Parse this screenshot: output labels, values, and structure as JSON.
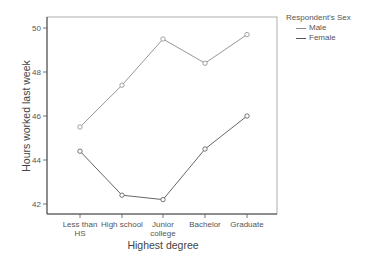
{
  "chart_data": {
    "type": "line",
    "title": "",
    "xlabel": "Highest degree",
    "ylabel": "Hours worked last week",
    "categories": [
      "Less than HS",
      "High school",
      "Junior college",
      "Bachelor",
      "Graduate"
    ],
    "category_lines": [
      [
        "Less than",
        "HS"
      ],
      [
        "High school"
      ],
      [
        "Junior",
        "college"
      ],
      [
        "Bachelor"
      ],
      [
        "Graduate"
      ]
    ],
    "series": [
      {
        "name": "Male",
        "color": "#8a8a8a",
        "values": [
          45.5,
          47.4,
          49.5,
          48.4,
          49.7
        ]
      },
      {
        "name": "Female",
        "color": "#555555",
        "values": [
          44.4,
          42.4,
          42.2,
          44.5,
          46.0
        ]
      }
    ],
    "ylim": [
      41.5,
      50.5
    ],
    "yticks": [
      42,
      44,
      46,
      48,
      50
    ],
    "grid": false,
    "markers": "open-circle",
    "legend": {
      "title": "Respondent's Sex",
      "position": "right-outside"
    }
  },
  "legend": {
    "title": "Respondent's Sex",
    "items": [
      {
        "label": "Male",
        "color": "#8a8a8a"
      },
      {
        "label": "Female",
        "color": "#555555"
      }
    ]
  }
}
